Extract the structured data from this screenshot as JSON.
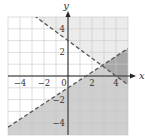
{
  "chart_data": {
    "type": "line",
    "title": "",
    "xlabel": "x",
    "ylabel": "y",
    "xlim": [
      -5,
      5
    ],
    "ylim": [
      -5,
      5
    ],
    "grid": true,
    "x_ticks": [
      {
        "value": -4,
        "label": "−4"
      },
      {
        "value": -2,
        "label": "−2"
      },
      {
        "value": 0,
        "label": "0"
      },
      {
        "value": 2,
        "label": "2"
      },
      {
        "value": 4,
        "label": "4"
      }
    ],
    "y_ticks": [
      {
        "value": 4,
        "label": "4"
      },
      {
        "value": 2,
        "label": "2"
      },
      {
        "value": -2,
        "label": "−2"
      },
      {
        "value": -4,
        "label": "−4"
      }
    ],
    "series": [
      {
        "name": "boundary-1",
        "style": "dashed",
        "slope": -0.75,
        "intercept": 3,
        "shade": "above",
        "shade_color": "#ececec"
      },
      {
        "name": "boundary-2",
        "style": "dashed",
        "slope": 0.6667,
        "intercept": -1,
        "shade": "below",
        "shade_color": "#cfcfcf"
      }
    ],
    "overlap_color": "#a8a8a8"
  }
}
